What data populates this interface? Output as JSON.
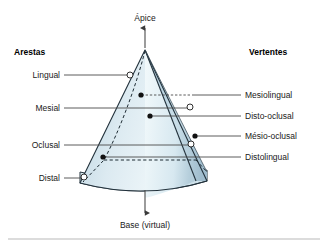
{
  "figure": {
    "top_axis_label": "Ápice",
    "bottom_axis_label": "Base (virtual)",
    "left_column_heading": "Arestas",
    "right_column_heading": "Vertentes",
    "left_labels": [
      {
        "text": "Lingual",
        "marker": "open-circle"
      },
      {
        "text": "Mesial",
        "marker": "open-circle"
      },
      {
        "text": "Oclusal",
        "marker": "open-circle"
      },
      {
        "text": "Distal",
        "marker": "open-circle"
      }
    ],
    "right_labels": [
      {
        "text": "Mesiolingual",
        "marker": "filled-dot"
      },
      {
        "text": "Disto-oclusal",
        "marker": "filled-dot"
      },
      {
        "text": "Mésio-oclusal",
        "marker": "filled-dot"
      },
      {
        "text": "Distolingual",
        "marker": "filled-dot"
      }
    ],
    "colors": {
      "face_light": "#eef6fa",
      "face_mid": "#cfe3ec",
      "face_dark": "#a9c6d6",
      "outline": "#23323c",
      "leader": "#4a4a4a",
      "text": "#1a1a1a",
      "background": "#ffffff",
      "rule": "#b9b9b9"
    }
  }
}
